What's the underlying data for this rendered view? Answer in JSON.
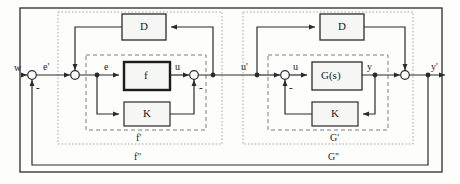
{
  "diagram": {
    "colors": {
      "line": "#2b2b2b",
      "dashed_inner": "#6a6a6a",
      "dotted_group": "#9a9a9a",
      "block_fill": "#f6f6f4",
      "background": "#fdfdfc"
    },
    "blocks": [
      {
        "id": "d-left",
        "label": "D",
        "x": 122,
        "y": 14,
        "w": 44,
        "h": 26,
        "weight": "normal"
      },
      {
        "id": "f-left",
        "label": "f",
        "x": 124,
        "y": 62,
        "w": 46,
        "h": 28,
        "weight": "bold"
      },
      {
        "id": "k-left",
        "label": "K",
        "x": 124,
        "y": 102,
        "w": 46,
        "h": 24,
        "weight": "normal"
      },
      {
        "id": "d-right",
        "label": "D",
        "x": 320,
        "y": 14,
        "w": 44,
        "h": 26,
        "weight": "normal"
      },
      {
        "id": "g-right",
        "label": "G(s)",
        "x": 312,
        "y": 62,
        "w": 50,
        "h": 28,
        "weight": "normal"
      },
      {
        "id": "k-right",
        "label": "K",
        "x": 312,
        "y": 102,
        "w": 46,
        "h": 24,
        "weight": "normal"
      }
    ],
    "signals": [
      {
        "id": "w",
        "label": "w",
        "x": 14,
        "y": 64
      },
      {
        "id": "e-prime",
        "label": "e'",
        "x": 43,
        "y": 63
      },
      {
        "id": "e",
        "label": "e",
        "x": 104,
        "y": 63
      },
      {
        "id": "u-left",
        "label": "u",
        "x": 175,
        "y": 63
      },
      {
        "id": "u-prime",
        "label": "u'",
        "x": 243,
        "y": 63
      },
      {
        "id": "u-right",
        "label": "u",
        "x": 293,
        "y": 63
      },
      {
        "id": "y",
        "label": "y",
        "x": 368,
        "y": 63
      },
      {
        "id": "y-prime",
        "label": "y'",
        "x": 432,
        "y": 63
      }
    ],
    "minus_signs": [
      {
        "id": "minus-outer-left",
        "label": "-",
        "x": 36,
        "y": 85
      },
      {
        "id": "minus-f-local",
        "label": "-",
        "x": 200,
        "y": 85
      },
      {
        "id": "minus-g-local",
        "label": "-",
        "x": 289,
        "y": 85
      }
    ],
    "group_labels": [
      {
        "id": "f-prime",
        "label": "f'",
        "x": 136,
        "y": 134
      },
      {
        "id": "f-dprime",
        "label": "f''",
        "x": 136,
        "y": 154
      },
      {
        "id": "g-prime",
        "label": "G'",
        "x": 330,
        "y": 134
      },
      {
        "id": "g-dprime",
        "label": "G''",
        "x": 330,
        "y": 154
      }
    ],
    "junctions": [
      {
        "id": "sum-w-feedback",
        "x": 32,
        "y": 75,
        "type": "circle"
      },
      {
        "id": "sum-eprime-d",
        "x": 75,
        "y": 75,
        "type": "circle"
      },
      {
        "id": "node-e-branch",
        "x": 97,
        "y": 75,
        "type": "dot"
      },
      {
        "id": "sum-u-k",
        "x": 194,
        "y": 75,
        "type": "circle"
      },
      {
        "id": "node-uprime",
        "x": 227,
        "y": 75,
        "type": "dot"
      },
      {
        "id": "node-uprime-tap",
        "x": 257,
        "y": 75,
        "type": "dot"
      },
      {
        "id": "sum-u-kright",
        "x": 285,
        "y": 75,
        "type": "circle"
      },
      {
        "id": "node-y-branch",
        "x": 375,
        "y": 75,
        "type": "dot"
      },
      {
        "id": "sum-y-d",
        "x": 405,
        "y": 75,
        "type": "circle"
      },
      {
        "id": "node-yprime",
        "x": 428,
        "y": 75,
        "type": "dot"
      }
    ],
    "boundaries": [
      {
        "id": "f-prime-dashed",
        "x": 86,
        "y": 55,
        "w": 120,
        "h": 75,
        "style": "dashed"
      },
      {
        "id": "f-dprime-dotted",
        "x": 58,
        "y": 12,
        "w": 164,
        "h": 132,
        "style": "dotted"
      },
      {
        "id": "g-prime-dashed",
        "x": 268,
        "y": 55,
        "w": 120,
        "h": 75,
        "style": "dashed"
      },
      {
        "id": "g-dprime-dotted",
        "x": 243,
        "y": 12,
        "w": 170,
        "h": 132,
        "style": "dotted"
      },
      {
        "id": "outer-frame",
        "x": 20,
        "y": 8,
        "w": 422,
        "h": 164,
        "style": "solid"
      }
    ]
  }
}
